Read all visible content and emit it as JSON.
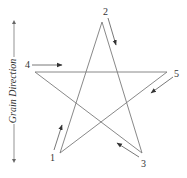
{
  "figure": {
    "grain_direction_label": "Grain Direction",
    "points": [
      {
        "id": "1",
        "label": "1",
        "x": 60,
        "y": 153,
        "label_x": 50,
        "label_y": 161
      },
      {
        "id": "2",
        "label": "2",
        "x": 102,
        "y": 22,
        "label_x": 103,
        "label_y": 15
      },
      {
        "id": "3",
        "label": "3",
        "x": 142,
        "y": 153,
        "label_x": 141,
        "label_y": 167
      },
      {
        "id": "4",
        "label": "4",
        "x": 35,
        "y": 72,
        "label_x": 25,
        "label_y": 68
      },
      {
        "id": "5",
        "label": "5",
        "x": 167,
        "y": 72,
        "label_x": 174,
        "label_y": 77
      }
    ],
    "stroke_order": [
      "1",
      "2",
      "3",
      "4",
      "5",
      "1"
    ],
    "arrows": [
      {
        "name": "arrow-1",
        "from": [
          54,
          150
        ],
        "to": [
          62,
          125
        ]
      },
      {
        "name": "arrow-2",
        "from": [
          108,
          18
        ],
        "to": [
          116,
          45
        ]
      },
      {
        "name": "arrow-3",
        "from": [
          139,
          157
        ],
        "to": [
          117,
          143
        ]
      },
      {
        "name": "arrow-4",
        "from": [
          32,
          65
        ],
        "to": [
          62,
          65
        ]
      },
      {
        "name": "arrow-5",
        "from": [
          173,
          77
        ],
        "to": [
          151,
          93
        ]
      }
    ],
    "colors": {
      "star": "#7a7a7a",
      "arrows": "#555555",
      "text": "#333333",
      "background": "#ffffff"
    }
  }
}
